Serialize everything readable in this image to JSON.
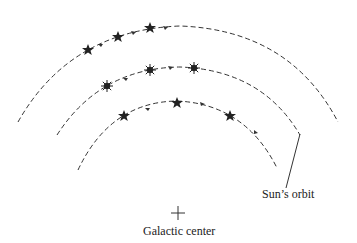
{
  "diagram": {
    "orbits": [
      {
        "name": "outer",
        "stars": 3,
        "star_style": "star"
      },
      {
        "name": "middle",
        "stars": 3,
        "star_style": "sunburst"
      },
      {
        "name": "inner",
        "stars": 3,
        "star_style": "star"
      }
    ],
    "labels": {
      "sun_orbit": "Sun’s orbit",
      "galactic_center": "Galactic center"
    },
    "colors": {
      "line": "#333333",
      "star": "#222222",
      "background": "#ffffff"
    }
  }
}
